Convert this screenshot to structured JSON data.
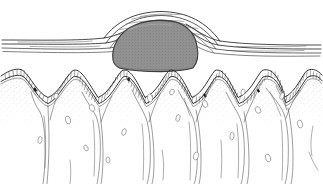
{
  "figure": {
    "title": "Nodular mass beneath stratified membrane overlying folded epithelium",
    "type": "anatomical-line-illustration",
    "background_color": "#ffffff",
    "width": 323,
    "height": 184,
    "has_text_labels": false,
    "line_color": "#2b2b2b"
  },
  "colors": {
    "ink": "#2b2b2b",
    "hairline": "#4a4a4a",
    "mass_fill": "#8e8e8e",
    "mass_fill_light": "#9a9a9a",
    "mass_outline": "#3a3a3a",
    "stipple": "#7d7d7d",
    "cell_outline": "#6a6a6a",
    "background": "#ffffff"
  },
  "structures": [
    {
      "id": "surface-membrane",
      "name": "surface membrane layers",
      "description": "Set of thin parallel bands running horizontally across the full width, arching upward over the central mass",
      "band_count": 5,
      "y_left": 42,
      "y_right": 48,
      "arc_apex_y": 13
    },
    {
      "id": "nodular-mass",
      "name": "nodular mass",
      "description": "Gray stippled dome-shaped nodule occupying the central upper region",
      "fill": "#8e8e8e",
      "center_x": 161,
      "top_y": 22,
      "bottom_y": 70,
      "left_x": 112,
      "right_x": 196
    },
    {
      "id": "epithelium",
      "name": "folded epithelial band",
      "description": "Undulating cellular band with rectangular cell subdivisions forming rete ridges",
      "segment_count": 96,
      "crest_count": 6,
      "trough_count": 6,
      "y_baseline": 80
    },
    {
      "id": "stroma",
      "name": "underlying stroma",
      "description": "Stippled connective tissue beneath epithelium containing branching vessels and scattered oval cells",
      "oval_cell_count": 26,
      "vessel_bundle_count": 5
    }
  ],
  "epithelium_path": {
    "crests_x": [
      22,
      73,
      122,
      168,
      214,
      262,
      306
    ],
    "troughs_x": [
      48,
      98,
      145,
      191,
      238,
      284
    ],
    "crest_y": 73,
    "trough_y": 100
  },
  "oval_cells": [
    {
      "x": 68,
      "y": 120,
      "w": 5,
      "h": 8,
      "r": -15
    },
    {
      "x": 40,
      "y": 140,
      "w": 4,
      "h": 7,
      "r": 10
    },
    {
      "x": 92,
      "y": 108,
      "w": 5,
      "h": 7,
      "r": -25
    },
    {
      "x": 124,
      "y": 132,
      "w": 4,
      "h": 7,
      "r": 20
    },
    {
      "x": 150,
      "y": 98,
      "w": 5,
      "h": 8,
      "r": -10
    },
    {
      "x": 178,
      "y": 118,
      "w": 4,
      "h": 7,
      "r": 15
    },
    {
      "x": 205,
      "y": 104,
      "w": 5,
      "h": 7,
      "r": -20
    },
    {
      "x": 232,
      "y": 136,
      "w": 4,
      "h": 8,
      "r": 5
    },
    {
      "x": 258,
      "y": 110,
      "w": 5,
      "h": 7,
      "r": -30
    },
    {
      "x": 282,
      "y": 96,
      "w": 4,
      "h": 7,
      "r": 18
    },
    {
      "x": 300,
      "y": 124,
      "w": 5,
      "h": 8,
      "r": -12
    },
    {
      "x": 56,
      "y": 96,
      "w": 4,
      "h": 6,
      "r": 22
    },
    {
      "x": 108,
      "y": 160,
      "w": 4,
      "h": 6,
      "r": -8
    },
    {
      "x": 196,
      "y": 156,
      "w": 5,
      "h": 8,
      "r": 12
    },
    {
      "x": 268,
      "y": 158,
      "w": 5,
      "h": 8,
      "r": -18
    },
    {
      "x": 172,
      "y": 92,
      "w": 4,
      "h": 6,
      "r": 28
    },
    {
      "x": 86,
      "y": 148,
      "w": 4,
      "h": 6,
      "r": -22
    },
    {
      "x": 243,
      "y": 92,
      "w": 4,
      "h": 6,
      "r": 14
    }
  ]
}
